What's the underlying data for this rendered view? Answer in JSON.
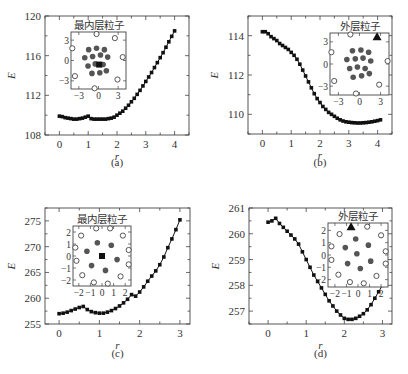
{
  "figure": {
    "panel_labels": [
      "(a)",
      "(b)",
      "(c)",
      "(d)"
    ]
  },
  "colors": {
    "axis": "#444444",
    "series": "#111111",
    "inner_particle": "#555555",
    "outer_particle_stroke": "#444444",
    "marker_highlight": "#111111"
  },
  "chart_data": [
    {
      "id": "a",
      "type": "line",
      "panel_label": "(a)",
      "xlabel": "r",
      "ylabel": "E",
      "xlim": [
        -0.5,
        4.5
      ],
      "ylim": [
        108,
        120
      ],
      "xticks": [
        0,
        1,
        2,
        3,
        4
      ],
      "yticks": [
        108,
        112,
        116,
        120
      ],
      "frame": {
        "x": 45,
        "y": 16,
        "w": 144,
        "h": 119
      },
      "label_y": 166,
      "x": [
        0,
        0.1,
        0.2,
        0.3,
        0.4,
        0.5,
        0.6,
        0.7,
        0.8,
        0.9,
        1.0,
        1.1,
        1.2,
        1.3,
        1.4,
        1.5,
        1.6,
        1.7,
        1.8,
        1.9,
        2.0,
        2.1,
        2.2,
        2.3,
        2.4,
        2.5,
        2.6,
        2.7,
        2.8,
        2.9,
        3.0,
        3.1,
        3.2,
        3.3,
        3.4,
        3.5,
        3.6,
        3.7,
        3.8,
        3.9,
        4.0
      ],
      "y": [
        109.9,
        109.85,
        109.75,
        109.7,
        109.65,
        109.6,
        109.6,
        109.65,
        109.7,
        109.8,
        109.9,
        109.65,
        109.6,
        109.6,
        109.6,
        109.6,
        109.6,
        109.65,
        109.7,
        109.8,
        110.0,
        110.2,
        110.4,
        110.7,
        111.0,
        111.35,
        111.7,
        112.1,
        112.5,
        112.95,
        113.4,
        113.85,
        114.3,
        114.8,
        115.3,
        115.8,
        116.3,
        116.85,
        117.4,
        117.95,
        118.5
      ],
      "inset": {
        "title": "最内层粒子",
        "frame": {
          "x": 71,
          "y": 32,
          "w": 55,
          "h": 57
        },
        "lim": [
          -4.2,
          4.2
        ],
        "ticks": [
          -3,
          0,
          3
        ],
        "tick_labels": [
          "-3",
          "0",
          "3"
        ],
        "inner": [
          [
            -1.5,
            1.6
          ],
          [
            -0.3,
            1.8
          ],
          [
            0.9,
            1.6
          ],
          [
            -2.1,
            0.4
          ],
          [
            -0.9,
            0.6
          ],
          [
            0.3,
            0.8
          ],
          [
            1.4,
            0.5
          ],
          [
            -1.6,
            -0.8
          ],
          [
            -0.5,
            -0.5
          ],
          [
            0.7,
            -0.6
          ],
          [
            -1.0,
            -1.9
          ],
          [
            0.2,
            -1.8
          ],
          [
            1.2,
            -1.5
          ]
        ],
        "highlight": {
          "pos": [
            0.1,
            -0.6
          ],
          "shape": "square"
        },
        "outer": [
          [
            -0.3,
            3.9
          ],
          [
            2.5,
            3.3
          ],
          [
            -4.0,
            1.8
          ],
          [
            3.7,
            0.5
          ],
          [
            -3.6,
            -2.3
          ],
          [
            2.9,
            -2.8
          ],
          [
            -0.6,
            -4.1
          ]
        ]
      }
    },
    {
      "id": "b",
      "type": "line",
      "panel_label": "(b)",
      "xlabel": "r",
      "ylabel": "E",
      "xlim": [
        -0.5,
        4.5
      ],
      "ylim": [
        109,
        115
      ],
      "xticks": [
        0,
        1,
        2,
        3,
        4
      ],
      "yticks": [
        110,
        112,
        114
      ],
      "frame": {
        "x": 248,
        "y": 16,
        "w": 144,
        "h": 118
      },
      "label_y": 166,
      "x": [
        0,
        0.1,
        0.2,
        0.3,
        0.4,
        0.5,
        0.6,
        0.7,
        0.8,
        0.9,
        1.0,
        1.1,
        1.2,
        1.3,
        1.4,
        1.5,
        1.6,
        1.7,
        1.8,
        1.9,
        2.0,
        2.1,
        2.2,
        2.3,
        2.4,
        2.5,
        2.6,
        2.7,
        2.8,
        2.9,
        3.0,
        3.1,
        3.2,
        3.3,
        3.4,
        3.5,
        3.6,
        3.7,
        3.8,
        3.9,
        4.0,
        4.1
      ],
      "y": [
        114.2,
        114.2,
        114.1,
        113.95,
        113.85,
        113.75,
        113.6,
        113.5,
        113.4,
        113.3,
        113.15,
        113.0,
        112.8,
        112.55,
        112.25,
        111.95,
        111.65,
        111.35,
        111.05,
        110.8,
        110.6,
        110.4,
        110.25,
        110.1,
        110.0,
        109.9,
        109.8,
        109.72,
        109.66,
        109.62,
        109.6,
        109.58,
        109.57,
        109.56,
        109.56,
        109.57,
        109.58,
        109.6,
        109.62,
        109.65,
        109.68,
        109.72
      ],
      "inset": {
        "title": "外层粒子",
        "frame": {
          "x": 330,
          "y": 33,
          "w": 59,
          "h": 62
        },
        "lim": [
          -4.2,
          4.2
        ],
        "ticks": [
          -3,
          0,
          3
        ],
        "tick_labels": [
          "-3",
          "0",
          "3"
        ],
        "inner": [
          [
            -1.0,
            1.8
          ],
          [
            0.2,
            1.9
          ],
          [
            1.3,
            1.6
          ],
          [
            -1.8,
            0.6
          ],
          [
            -0.6,
            0.7
          ],
          [
            0.5,
            0.8
          ],
          [
            1.6,
            0.4
          ],
          [
            -1.4,
            -0.6
          ],
          [
            -0.3,
            -0.4
          ],
          [
            0.8,
            -0.6
          ],
          [
            -0.9,
            -1.8
          ],
          [
            0.3,
            -1.6
          ],
          [
            1.4,
            -1.3
          ]
        ],
        "highlight": {
          "pos": [
            2.5,
            3.7
          ],
          "shape": "triangle"
        },
        "outer": [
          [
            -1.3,
            4.0
          ],
          [
            -4.0,
            1.6
          ],
          [
            4.0,
            0.4
          ],
          [
            -3.6,
            -2.3
          ],
          [
            2.8,
            -2.8
          ],
          [
            -0.5,
            -4.0
          ]
        ]
      }
    },
    {
      "id": "c",
      "type": "line",
      "panel_label": "(c)",
      "xlabel": "r",
      "ylabel": "E",
      "xlim": [
        -0.35,
        3.25
      ],
      "ylim": [
        255,
        277.5
      ],
      "xticks": [
        0,
        1,
        2,
        3
      ],
      "yticks": [
        255,
        260,
        265,
        270,
        275
      ],
      "frame": {
        "x": 45,
        "y": 208,
        "w": 145,
        "h": 116
      },
      "label_y": 357,
      "x": [
        0,
        0.1,
        0.2,
        0.3,
        0.4,
        0.5,
        0.6,
        0.7,
        0.8,
        0.9,
        1.0,
        1.1,
        1.2,
        1.3,
        1.4,
        1.5,
        1.6,
        1.7,
        1.8,
        1.9,
        2.0,
        2.1,
        2.2,
        2.3,
        2.4,
        2.5,
        2.6,
        2.7,
        2.8,
        2.9,
        3.0
      ],
      "y": [
        257.0,
        257.1,
        257.3,
        257.6,
        257.9,
        258.2,
        258.4,
        257.8,
        257.4,
        257.2,
        257.1,
        257.1,
        257.3,
        257.6,
        258.0,
        258.5,
        259.1,
        259.8,
        260.7,
        260.4,
        261.2,
        262.2,
        263.3,
        264.3,
        265.3,
        266.5,
        268.0,
        269.8,
        271.5,
        273.3,
        275.2
      ],
      "inset": {
        "title": "最内层粒子",
        "frame": {
          "x": 73,
          "y": 226,
          "w": 58,
          "h": 60
        },
        "lim": [
          -2.5,
          2.5
        ],
        "ticks": [
          -2,
          -1,
          0,
          1,
          2
        ],
        "tick_labels": [
          "-2",
          "-1",
          "0",
          "1",
          "2"
        ],
        "inner": [
          [
            -0.4,
            1.1
          ],
          [
            0.8,
            0.9
          ],
          [
            -1.3,
            0.4
          ],
          [
            1.3,
            -0.3
          ],
          [
            -0.9,
            -0.8
          ],
          [
            0.3,
            -1.2
          ]
        ],
        "highlight": {
          "pos": [
            0,
            0
          ],
          "shape": "square"
        },
        "outer": [
          [
            -0.5,
            2.3
          ],
          [
            0.7,
            2.3
          ],
          [
            -1.8,
            1.7
          ],
          [
            1.8,
            1.7
          ],
          [
            -2.3,
            0.7
          ],
          [
            2.3,
            0.5
          ],
          [
            -2.2,
            -0.4
          ],
          [
            2.3,
            -0.7
          ],
          [
            -1.7,
            -1.6
          ],
          [
            1.6,
            -1.7
          ],
          [
            -0.7,
            -2.2
          ],
          [
            0.5,
            -2.3
          ]
        ]
      }
    },
    {
      "id": "d",
      "type": "line",
      "panel_label": "(d)",
      "xlabel": "r",
      "ylabel": "E",
      "xlim": [
        -0.5,
        3.25
      ],
      "ylim": [
        256.5,
        261
      ],
      "xticks": [
        0,
        1,
        2,
        3
      ],
      "yticks": [
        257,
        258,
        259,
        260,
        261
      ],
      "frame": {
        "x": 249,
        "y": 208,
        "w": 143,
        "h": 116
      },
      "label_y": 357,
      "x": [
        0,
        0.1,
        0.2,
        0.3,
        0.4,
        0.5,
        0.6,
        0.7,
        0.8,
        0.9,
        1.0,
        1.1,
        1.2,
        1.3,
        1.4,
        1.5,
        1.6,
        1.7,
        1.8,
        1.9,
        2.0,
        2.1,
        2.2,
        2.3,
        2.4,
        2.5,
        2.6,
        2.7,
        2.8,
        2.9,
        3.0
      ],
      "y": [
        260.45,
        260.5,
        260.6,
        260.4,
        260.25,
        260.1,
        259.95,
        259.8,
        259.6,
        259.3,
        259.0,
        258.7,
        258.4,
        258.15,
        257.9,
        257.65,
        257.4,
        257.2,
        257.0,
        256.85,
        256.72,
        256.68,
        256.68,
        256.72,
        256.8,
        256.9,
        257.05,
        257.25,
        257.5,
        257.75,
        258.0
      ],
      "inset": {
        "title": "外层粒子",
        "frame": {
          "x": 328,
          "y": 223,
          "w": 60,
          "h": 64
        },
        "lim": [
          -2.6,
          2.6
        ],
        "ticks": [
          -2,
          -1,
          0,
          1,
          2
        ],
        "tick_labels": [
          "-2",
          "-1",
          "0",
          "1",
          "2"
        ],
        "inner": [
          [
            -0.2,
            1.3
          ],
          [
            -1.1,
            0.6
          ],
          [
            0.9,
            0.8
          ],
          [
            -0.1,
            0.1
          ],
          [
            1.1,
            -0.5
          ],
          [
            -0.9,
            -0.7
          ],
          [
            0.2,
            -1.1
          ]
        ],
        "highlight": {
          "pos": [
            -0.6,
            2.3
          ],
          "shape": "triangle"
        },
        "outer": [
          [
            0.8,
            2.3
          ],
          [
            -1.6,
            1.7
          ],
          [
            2.0,
            1.6
          ],
          [
            -2.3,
            0.7
          ],
          [
            2.4,
            0.3
          ],
          [
            -2.3,
            -0.4
          ],
          [
            2.4,
            -0.7
          ],
          [
            -1.7,
            -1.6
          ],
          [
            1.6,
            -1.7
          ],
          [
            -0.7,
            -2.2
          ],
          [
            0.5,
            -2.3
          ]
        ]
      }
    }
  ]
}
